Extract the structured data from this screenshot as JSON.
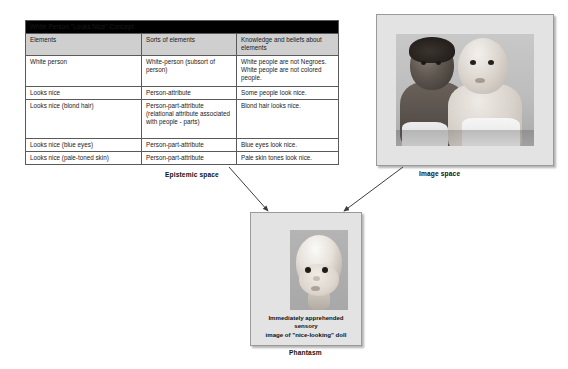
{
  "diagram": {
    "epistemic": {
      "label": "Epistemic space",
      "table": {
        "title": "White Person \"Looks Nice\" Concept",
        "columns": [
          "Elements",
          "Sorts of elements",
          "Knowledge and beliefs about elements"
        ],
        "rows": [
          {
            "element": "White person",
            "sort": "White-person (subsort of person)",
            "knowledge": "White people are not Negroes. White people are not colored people."
          },
          {
            "element": "Looks nice",
            "sort": "Person-attribute",
            "knowledge": "Some people look nice."
          },
          {
            "element": "Looks nice (blond hair)",
            "sort": "Person-part-attribute (relational attribute associated with people - parts)",
            "knowledge": "Blond hair looks nice."
          },
          {
            "element": "Looks nice (blue eyes)",
            "sort": "Person-part-attribute",
            "knowledge": "Blue eyes look nice."
          },
          {
            "element": "Looks nice (pale-toned skin)",
            "sort": "Person-part-attribute",
            "knowledge": "Pale skin tones look nice."
          }
        ]
      }
    },
    "image_space": {
      "label": "Image space",
      "photo_alt": "Two dolls, one dark-skinned and one light-skinned, seated side by side"
    },
    "phantasm": {
      "label": "Phantasm",
      "caption_line1": "Immediately apprehended sensory",
      "caption_line2": "image of \"nice-looking\" doll",
      "photo_alt": "Close-up of a light-skinned doll head"
    },
    "connectors": [
      {
        "name": "epistemic-to-phantasm",
        "from": "Epistemic space",
        "to": "Phantasm"
      },
      {
        "name": "image-to-phantasm",
        "from": "Image space",
        "to": "Phantasm"
      }
    ],
    "colors": {
      "title_bar_bg": "#000000",
      "title_bar_text": "#ffffff",
      "column_header_bg": "#cfcfcf",
      "panel_bg": "#e3e3e3",
      "border": "#5a5a5a",
      "page_bg": "#ffffff"
    }
  }
}
